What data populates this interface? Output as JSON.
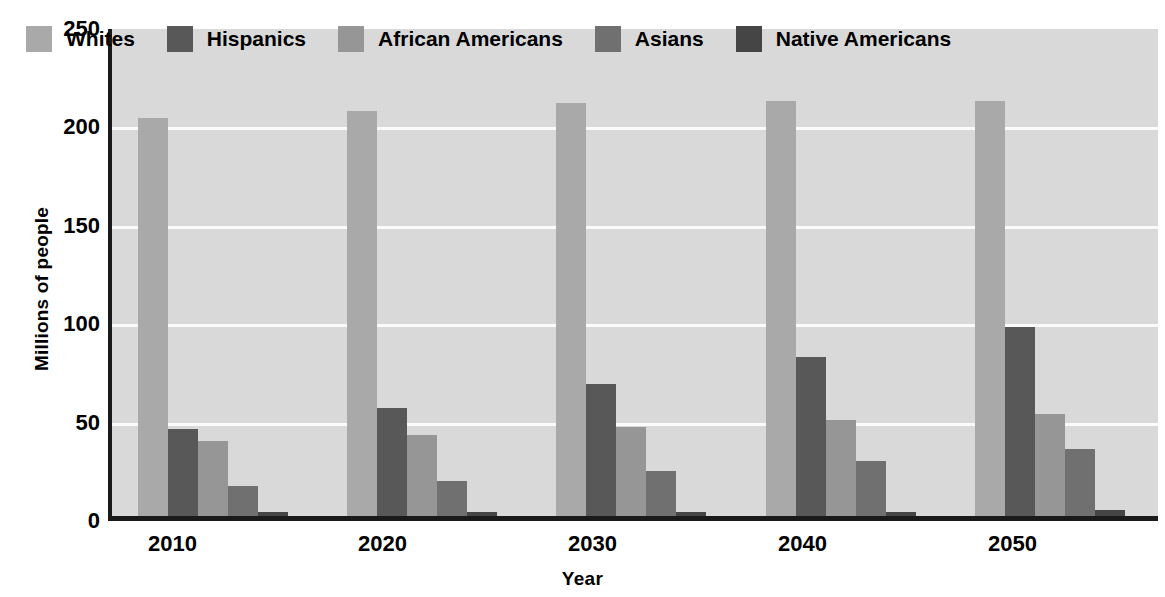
{
  "chart_data": {
    "type": "bar",
    "title": "",
    "xlabel": "Year",
    "ylabel": "Millions of people",
    "categories": [
      "2010",
      "2020",
      "2030",
      "2040",
      "2050"
    ],
    "ylim": [
      0,
      250
    ],
    "yticks": [
      0,
      50,
      100,
      150,
      200,
      250
    ],
    "grid": true,
    "grid_color": "#fbfbfb",
    "plot_background": "#d9d9d9",
    "legend_position": "top-left-inside",
    "series": [
      {
        "name": "Whites",
        "color": "#a9a9a9",
        "values": [
          202,
          206,
          210,
          211,
          211
        ]
      },
      {
        "name": "Hispanics",
        "color": "#585858",
        "values": [
          44,
          55,
          67,
          81,
          96
        ]
      },
      {
        "name": "African Americans",
        "color": "#969696",
        "values": [
          38,
          41,
          45,
          49,
          52
        ]
      },
      {
        "name": "Asians",
        "color": "#707070",
        "values": [
          15,
          18,
          23,
          28,
          34
        ]
      },
      {
        "name": "Native Americans",
        "color": "#454545",
        "values": [
          2,
          2,
          2,
          2,
          3
        ]
      }
    ]
  }
}
